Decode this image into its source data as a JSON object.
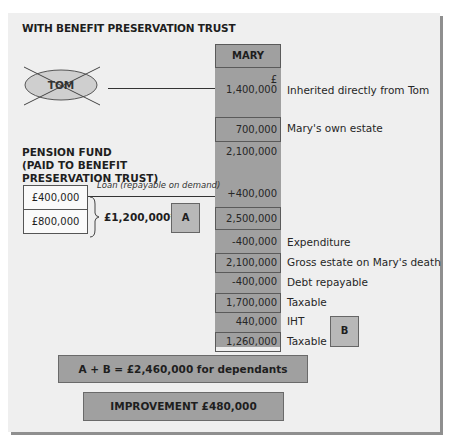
{
  "title": "WITH BENEFIT PRESERVATION TRUST",
  "tom": {
    "label": "TOM",
    "crossed_out": true
  },
  "mary": {
    "header": "MARY",
    "currency_symbol": "£",
    "rows": [
      {
        "value": "1,400,000",
        "label": "Inherited directly from Tom",
        "boxed": false
      },
      {
        "value": "700,000",
        "label": "Mary's own estate",
        "boxed": true
      },
      {
        "value": "2,100,000",
        "label": "",
        "boxed": false
      },
      {
        "value": "+400,000",
        "label": "",
        "boxed": false
      },
      {
        "value": "2,500,000",
        "label": "",
        "boxed": true
      },
      {
        "value": "-400,000",
        "label": "Expenditure",
        "boxed": false
      },
      {
        "value": "2,100,000",
        "label": "Gross estate on Mary's death",
        "boxed": true
      },
      {
        "value": "-400,000",
        "label": "Debt repayable",
        "boxed": false
      },
      {
        "value": "1,700,000",
        "label": "Taxable",
        "boxed": true
      },
      {
        "value": "440,000",
        "label": "IHT",
        "boxed": false
      },
      {
        "value": "1,260,000",
        "label": "Taxable",
        "boxed": true
      }
    ]
  },
  "pension": {
    "heading_lines": [
      "PENSION FUND",
      "(PAID TO BENEFIT",
      "PRESERVATION TRUST)"
    ],
    "loan_label": "Loan (repayable on demand)",
    "box_top": "£400,000",
    "box_bottom": "£800,000",
    "total": "£1,200,000*",
    "tag": "A"
  },
  "tag_b": "B",
  "summary": "A + B = £2,460,000 for dependants",
  "improvement": "IMPROVEMENT £480,000",
  "colors": {
    "panel": "#efefef",
    "column": "#a0a0a0",
    "tag": "#b8b8b8",
    "shadow": "#8f8f8f"
  }
}
